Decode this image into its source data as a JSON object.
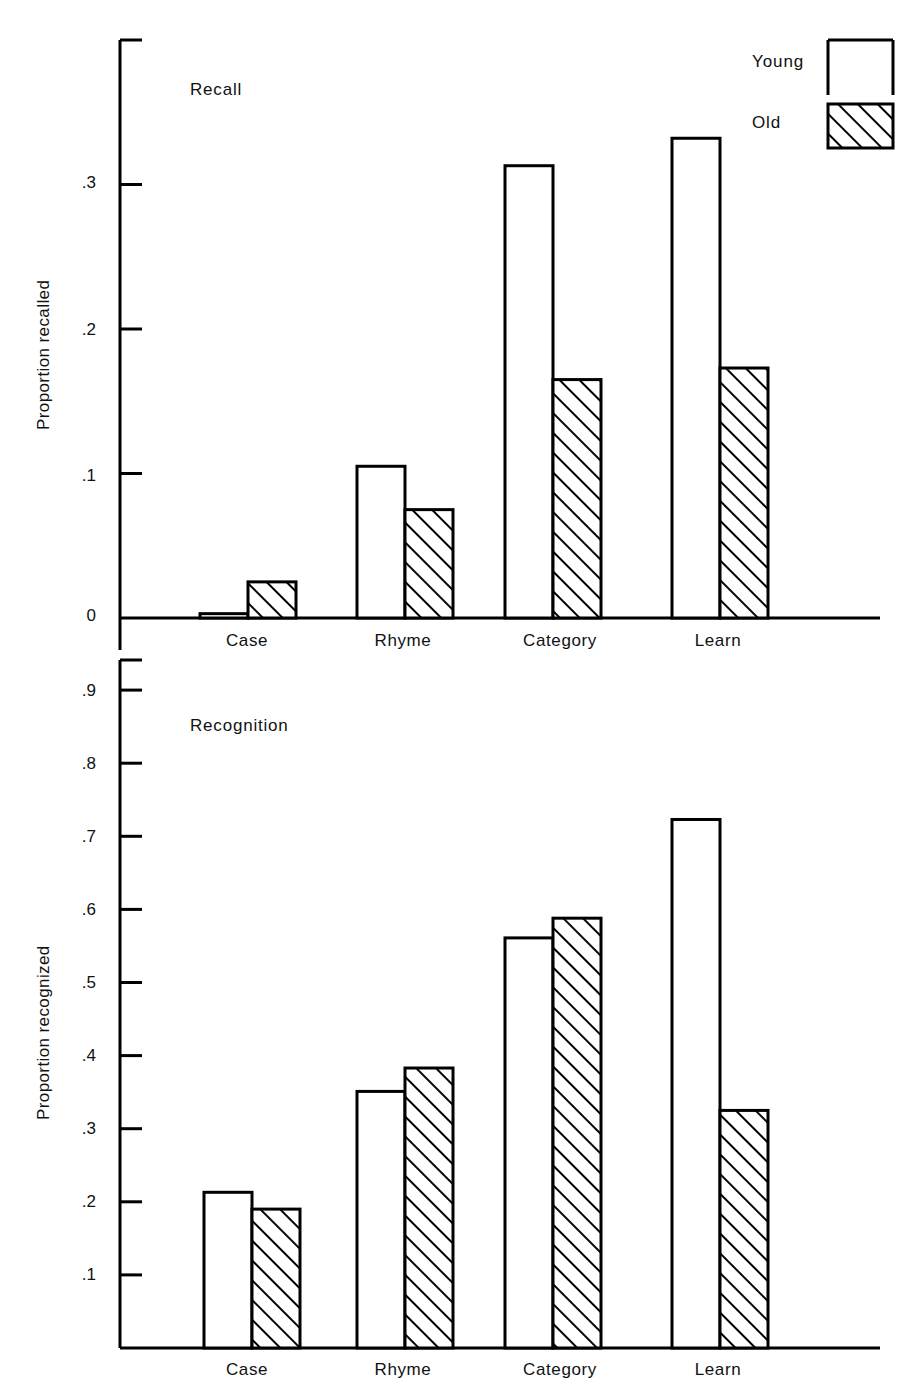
{
  "figure": {
    "background": "#ffffff",
    "ink_color": "#000000",
    "panels": [
      {
        "id": "recall",
        "title": "Recall",
        "ylabel": "Proportion recalled",
        "yticks": [
          "0",
          ".1",
          ".2",
          ".3"
        ],
        "xlabels": [
          "Case",
          "Rhyme",
          "Category",
          "Learn"
        ]
      },
      {
        "id": "recognition",
        "title": "Recognition",
        "ylabel": "Proportion recognized",
        "yticks": [
          ".1",
          ".2",
          ".3",
          ".4",
          ".5",
          ".6",
          ".7",
          ".8",
          ".9"
        ],
        "xlabels": [
          "Case",
          "Rhyme",
          "Category",
          "Learn"
        ]
      }
    ],
    "legend": {
      "position": "top-right",
      "entries": [
        {
          "label": "Young",
          "swatch": "open-bar-swatch"
        },
        {
          "label": "Old",
          "swatch": "hatched-bar-swatch"
        }
      ]
    }
  },
  "chart_data": [
    {
      "type": "bar",
      "id": "recall",
      "title": "Recall",
      "xlabel": "",
      "ylabel": "Proportion recalled",
      "categories": [
        "Case",
        "Rhyme",
        "Category",
        "Learn"
      ],
      "series": [
        {
          "name": "Young",
          "values": [
            0.003,
            0.105,
            0.313,
            0.332
          ]
        },
        {
          "name": "Old",
          "values": [
            0.025,
            0.075,
            0.165,
            0.173
          ]
        }
      ],
      "ylim": [
        0,
        0.375
      ],
      "ytick_values": [
        0,
        0.1,
        0.2,
        0.3
      ],
      "ytick_labels": [
        "0",
        ".1",
        ".2",
        ".3"
      ],
      "grid": false,
      "legend_position": "top-right"
    },
    {
      "type": "bar",
      "id": "recognition",
      "title": "Recognition",
      "xlabel": "",
      "ylabel": "Proportion recognized",
      "categories": [
        "Case",
        "Rhyme",
        "Category",
        "Learn"
      ],
      "series": [
        {
          "name": "Young",
          "values": [
            0.213,
            0.351,
            0.561,
            0.723
          ]
        },
        {
          "name": "Old",
          "values": [
            0.19,
            0.383,
            0.588,
            0.325
          ]
        }
      ],
      "ylim": [
        0,
        0.955
      ],
      "ytick_values": [
        0.1,
        0.2,
        0.3,
        0.4,
        0.5,
        0.6,
        0.7,
        0.8,
        0.9
      ],
      "ytick_labels": [
        ".1",
        ".2",
        ".3",
        ".4",
        ".5",
        ".6",
        ".7",
        ".8",
        ".9"
      ],
      "grid": false,
      "legend_position": "top-right"
    }
  ]
}
